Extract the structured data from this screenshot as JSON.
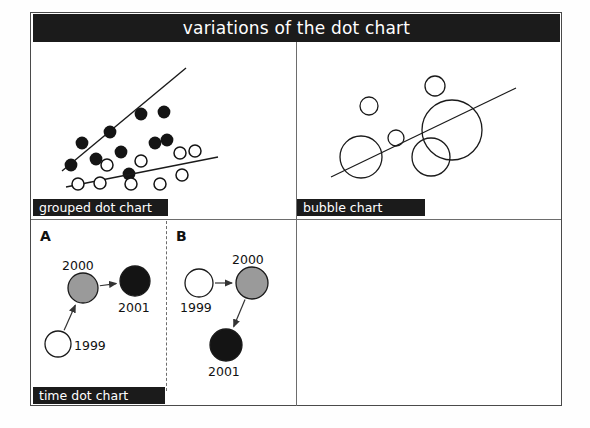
{
  "poster": {
    "title": "variations of the dot chart",
    "title_bg": "#1b1b1b",
    "title_fg": "#ffffff",
    "frame_border": "#4a4a4a"
  },
  "panels": [
    {
      "id": "grouped",
      "label": "grouped dot chart",
      "letter": ""
    },
    {
      "id": "bubble",
      "label": "bubble chart",
      "letter": ""
    },
    {
      "id": "time",
      "label": "time dot chart",
      "letter_a": "A",
      "letter_b": "B"
    }
  ],
  "time_dot_chart": {
    "panel_a": {
      "letter": "A",
      "nodes": [
        {
          "year": "1999",
          "fill": "#ffffff",
          "cx": 58,
          "cy": 344,
          "r": 13,
          "label_x": 74,
          "label_y": 338
        },
        {
          "year": "2000",
          "fill": "#9a9a9a",
          "cx": 83,
          "cy": 288,
          "r": 15,
          "label_x": 62,
          "label_y": 258
        },
        {
          "year": "2001",
          "fill": "#141414",
          "cx": 135,
          "cy": 281,
          "r": 15,
          "label_x": 118,
          "label_y": 300
        }
      ]
    },
    "panel_b": {
      "letter": "B",
      "nodes": [
        {
          "year": "1999",
          "fill": "#ffffff",
          "cx": 199,
          "cy": 283,
          "r": 14,
          "label_x": 180,
          "label_y": 300
        },
        {
          "year": "2000",
          "fill": "#9a9a9a",
          "cx": 252,
          "cy": 283,
          "r": 16,
          "label_x": 232,
          "label_y": 252
        },
        {
          "year": "2001",
          "fill": "#141414",
          "cx": 226,
          "cy": 345,
          "r": 16,
          "label_x": 208,
          "label_y": 364
        }
      ]
    }
  },
  "chart_data": [
    {
      "type": "scatter",
      "id": "grouped-dot-chart",
      "title": "grouped dot chart",
      "xlabel": "",
      "ylabel": "",
      "grid": false,
      "legend": "none",
      "series": [
        {
          "name": "filled-group",
          "marker": "filled-circle",
          "color": "#141414",
          "points": [
            [
              71,
              165
            ],
            [
              82,
              143
            ],
            [
              96,
              159
            ],
            [
              110,
              132
            ],
            [
              121,
              152
            ],
            [
              129,
              174
            ],
            [
              141,
              114
            ],
            [
              155,
              143
            ],
            [
              164,
              112
            ],
            [
              167,
              140
            ]
          ],
          "trendline": [
            [
              62,
              171
            ],
            [
              186,
              68
            ]
          ]
        },
        {
          "name": "open-group",
          "marker": "open-circle",
          "color": "#141414",
          "points": [
            [
              78,
              184
            ],
            [
              100,
              183
            ],
            [
              107,
              165
            ],
            [
              131,
              184
            ],
            [
              141,
              161
            ],
            [
              160,
              184
            ],
            [
              180,
              153
            ],
            [
              182,
              175
            ],
            [
              195,
              151
            ]
          ],
          "trendline": [
            [
              66,
              187
            ],
            [
              218,
              157
            ]
          ]
        }
      ]
    },
    {
      "type": "bubble",
      "id": "bubble-chart",
      "title": "bubble chart",
      "xlabel": "",
      "ylabel": "",
      "grid": false,
      "legend": "none",
      "bubbles": [
        {
          "cx": 369,
          "cy": 106,
          "r": 9
        },
        {
          "cx": 435,
          "cy": 86,
          "r": 10
        },
        {
          "cx": 396,
          "cy": 138,
          "r": 8
        },
        {
          "cx": 361,
          "cy": 157,
          "r": 21
        },
        {
          "cx": 431,
          "cy": 157,
          "r": 19
        },
        {
          "cx": 452,
          "cy": 130,
          "r": 30
        }
      ],
      "trendline": [
        [
          331,
          177
        ],
        [
          516,
          88
        ]
      ]
    }
  ]
}
